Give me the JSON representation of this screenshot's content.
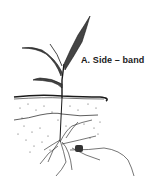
{
  "figure": {
    "label": "A. Side – band",
    "colors": {
      "ink": "#1a1a1a",
      "background": "#ffffff"
    }
  }
}
